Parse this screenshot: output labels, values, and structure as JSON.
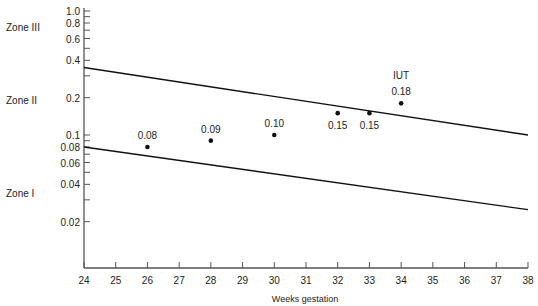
{
  "chart_data": {
    "type": "scatter",
    "title": "",
    "xlabel": "Weeks gestation",
    "ylabel": "",
    "xlim": [
      24,
      38
    ],
    "ylim": [
      0.01,
      1.0
    ],
    "yscale": "log",
    "grid": false,
    "x_ticks": [
      "24",
      "25",
      "26",
      "27",
      "28",
      "29",
      "30",
      "31",
      "32",
      "33",
      "34",
      "35",
      "36",
      "37",
      "38"
    ],
    "y_ticks": [
      {
        "value": 1.0,
        "label": "1.0"
      },
      {
        "value": 0.8,
        "label": "0.8"
      },
      {
        "value": 0.6,
        "label": "0.6"
      },
      {
        "value": 0.4,
        "label": "0.4"
      },
      {
        "value": 0.2,
        "label": "0.2"
      },
      {
        "value": 0.1,
        "label": "0.1"
      },
      {
        "value": 0.08,
        "label": "0.08"
      },
      {
        "value": 0.06,
        "label": "0.06"
      },
      {
        "value": 0.04,
        "label": "0.04"
      },
      {
        "value": 0.02,
        "label": "0.02"
      }
    ],
    "zones": [
      {
        "label": "Zone III"
      },
      {
        "label": "Zone II"
      },
      {
        "label": "Zone I"
      }
    ],
    "boundary_lines": [
      {
        "name": "Zone II/III boundary",
        "x": [
          24,
          38
        ],
        "y": [
          0.35,
          0.1
        ]
      },
      {
        "name": "Zone I/II boundary",
        "x": [
          24,
          38
        ],
        "y": [
          0.08,
          0.025
        ]
      }
    ],
    "series": [
      {
        "name": "Measurements",
        "points": [
          {
            "x": 26,
            "y": 0.08,
            "label": "0.08"
          },
          {
            "x": 28,
            "y": 0.09,
            "label": "0.09"
          },
          {
            "x": 30,
            "y": 0.1,
            "label": "0.10"
          },
          {
            "x": 32,
            "y": 0.15,
            "label": "0.15"
          },
          {
            "x": 33,
            "y": 0.15,
            "label": "0.15"
          },
          {
            "x": 34,
            "y": 0.18,
            "label": "0.18"
          }
        ]
      }
    ],
    "annotations": [
      {
        "text": "IUT",
        "x": 34,
        "y": 0.18
      }
    ]
  }
}
